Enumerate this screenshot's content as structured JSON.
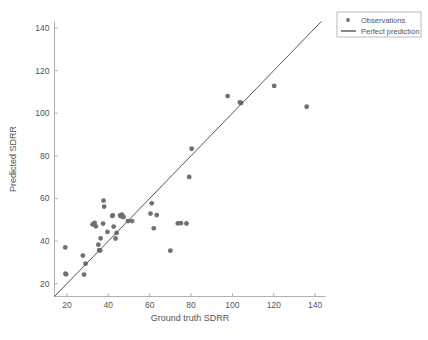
{
  "chart_data": {
    "type": "scatter",
    "title": "",
    "xlabel": "Ground truth SDRR",
    "ylabel": "Predicted SDRR",
    "xlim": [
      14,
      145
    ],
    "ylim": [
      14,
      143
    ],
    "xticks": [
      20,
      40,
      60,
      80,
      100,
      120,
      140
    ],
    "xtick_labels": [
      "20",
      "40",
      "60",
      "80",
      "100",
      "120",
      "140"
    ],
    "yticks": [
      20,
      40,
      60,
      80,
      100,
      120,
      140
    ],
    "ytick_labels": [
      "20",
      "40",
      "60",
      "80",
      "100",
      "120",
      "140"
    ],
    "grid": false,
    "legend_position": "top-right",
    "legend": [
      {
        "label": "Observations",
        "marker": "dot",
        "color": "#6e7075"
      },
      {
        "label": "Perfect prediction",
        "marker": "line",
        "color": "#55565a"
      }
    ],
    "series": [
      {
        "name": "Observations",
        "type": "scatter",
        "color": "#6e7075",
        "marker_size": 3.2,
        "points": [
          [
            19.2,
            37.0
          ],
          [
            19.3,
            24.7
          ],
          [
            19.6,
            24.4
          ],
          [
            27.7,
            33.2
          ],
          [
            28.3,
            24.3
          ],
          [
            29.0,
            29.4
          ],
          [
            32.4,
            47.8
          ],
          [
            33.4,
            48.5
          ],
          [
            34.0,
            46.9
          ],
          [
            35.2,
            38.3
          ],
          [
            35.6,
            35.7
          ],
          [
            36.1,
            35.6
          ],
          [
            36.3,
            41.3
          ],
          [
            37.5,
            48.2
          ],
          [
            37.7,
            59.0
          ],
          [
            38.0,
            56.2
          ],
          [
            39.6,
            44.3
          ],
          [
            41.9,
            51.8
          ],
          [
            42.2,
            52.0
          ],
          [
            42.6,
            46.8
          ],
          [
            43.5,
            41.2
          ],
          [
            44.0,
            43.8
          ],
          [
            45.7,
            52.0
          ],
          [
            46.3,
            51.6
          ],
          [
            46.6,
            52.4
          ],
          [
            47.4,
            51.3
          ],
          [
            49.5,
            49.4
          ],
          [
            51.5,
            49.4
          ],
          [
            60.4,
            52.9
          ],
          [
            61.0,
            57.7
          ],
          [
            62.0,
            46.0
          ],
          [
            63.4,
            52.2
          ],
          [
            70.0,
            35.5
          ],
          [
            73.6,
            48.3
          ],
          [
            75.1,
            48.4
          ],
          [
            77.8,
            48.3
          ],
          [
            79.1,
            70.1
          ],
          [
            80.3,
            83.3
          ],
          [
            97.7,
            108.0
          ],
          [
            103.6,
            105.0
          ],
          [
            104.2,
            104.8
          ],
          [
            120.2,
            112.8
          ],
          [
            135.9,
            103.0
          ]
        ]
      },
      {
        "name": "Perfect prediction",
        "type": "line",
        "color": "#55565a",
        "x": [
          14,
          143
        ],
        "y": [
          14,
          143
        ]
      }
    ]
  }
}
